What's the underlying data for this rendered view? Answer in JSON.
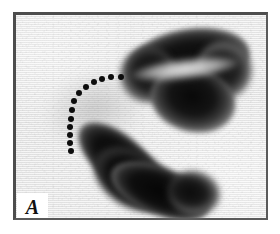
{
  "figure": {
    "panel_label": "A",
    "kind": "grayscale-autoradiograph-micrograph",
    "frame_color": "#4d4d4d",
    "background_color": "#ededec",
    "signal_color": "#0a0a0a",
    "annotation_color": "#0d0d0d"
  },
  "regions": [
    {
      "name": "upper-right-mass",
      "description": "large dark kidney-shaped labelled mass in upper right, split by a lighter diagonal notch into two lobes"
    },
    {
      "name": "lower-left-mass",
      "description": "elongated dark bean-shaped labelled mass running diagonally from lower left to lower right"
    },
    {
      "name": "interstitial-haze",
      "description": "faint gray haze between the two dark masses"
    }
  ],
  "annotation": {
    "name": "dotted-demarcation-arc",
    "style": "dotted",
    "dot_count": 13,
    "dot_diameter_px": 6,
    "points": [
      {
        "x": 105,
        "y": 62
      },
      {
        "x": 95,
        "y": 62
      },
      {
        "x": 86,
        "y": 64
      },
      {
        "x": 78,
        "y": 67
      },
      {
        "x": 70,
        "y": 72
      },
      {
        "x": 63,
        "y": 78
      },
      {
        "x": 58,
        "y": 86
      },
      {
        "x": 56,
        "y": 95
      },
      {
        "x": 55,
        "y": 104
      },
      {
        "x": 54,
        "y": 112
      },
      {
        "x": 54,
        "y": 120
      },
      {
        "x": 54,
        "y": 128
      },
      {
        "x": 55,
        "y": 136
      }
    ]
  }
}
